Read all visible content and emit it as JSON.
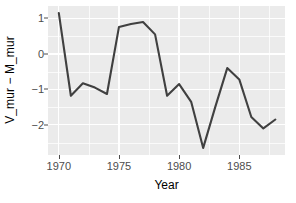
{
  "chart_data": {
    "type": "line",
    "title": "",
    "xlabel": "Year",
    "ylabel": "V_mur − M_mur",
    "xlim": [
      1969.1,
      1988.8
    ],
    "ylim": [
      -2.85,
      1.35
    ],
    "grid": true,
    "legend": "none",
    "line_color": "#404040",
    "panel_color": "#ebebeb",
    "gridline_color": "#ffffff",
    "x": [
      1970,
      1971,
      1972,
      1973,
      1974,
      1975,
      1976,
      1977,
      1978,
      1979,
      1980,
      1981,
      1982,
      1983,
      1984,
      1985,
      1986,
      1987,
      1988
    ],
    "values": [
      1.15,
      -1.18,
      -0.83,
      -0.95,
      -1.13,
      0.76,
      0.84,
      0.9,
      0.55,
      -1.18,
      -0.85,
      -1.35,
      -2.65,
      -1.5,
      -0.4,
      -0.72,
      -1.78,
      -2.1,
      -1.85
    ],
    "series": [
      {
        "name": "V_mur - M_mur",
        "values": [
          1.15,
          -1.18,
          -0.83,
          -0.95,
          -1.13,
          0.76,
          0.84,
          0.9,
          0.55,
          -1.18,
          -0.85,
          -1.35,
          -2.65,
          -1.5,
          -0.4,
          -0.72,
          -1.78,
          -2.1,
          -1.85
        ]
      }
    ],
    "x_ticks": [
      {
        "value": 1970,
        "label": "1970"
      },
      {
        "value": 1975,
        "label": "1975"
      },
      {
        "value": 1980,
        "label": "1980"
      },
      {
        "value": 1985,
        "label": "1985"
      }
    ],
    "x_minor_ticks": [
      1972.5,
      1977.5,
      1982.5,
      1987.5
    ],
    "y_ticks": [
      {
        "value": 1,
        "label": "1"
      },
      {
        "value": 0,
        "label": "0"
      },
      {
        "value": -1,
        "label": "−1"
      },
      {
        "value": -2,
        "label": "−2"
      }
    ],
    "y_minor_ticks": [
      1.5,
      0.5,
      -0.5,
      -1.5,
      -2.5
    ]
  }
}
